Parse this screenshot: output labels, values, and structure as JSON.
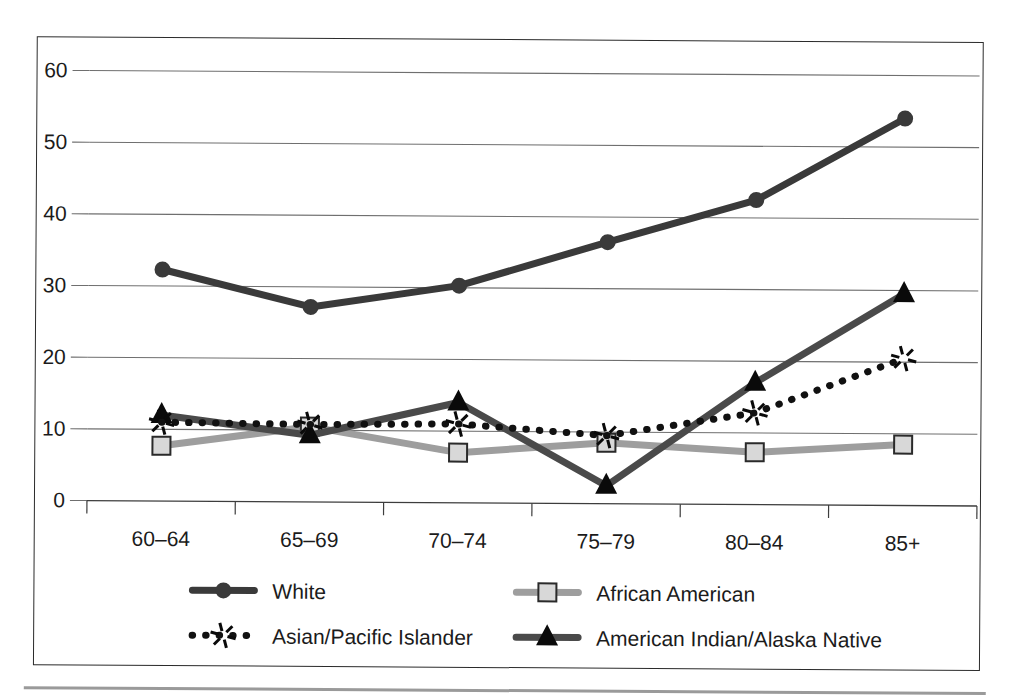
{
  "chart_data": {
    "type": "line",
    "title": "",
    "subtitle": "",
    "xlabel": "",
    "ylabel": "",
    "categories": [
      "60–64",
      "65–69",
      "70–74",
      "75–79",
      "80–84",
      "85+"
    ],
    "ylim": [
      0,
      60
    ],
    "yticks": [
      0,
      10,
      20,
      30,
      40,
      50,
      60
    ],
    "ytick_labels": [
      "0",
      "10",
      "20",
      "30",
      "40",
      "50",
      "60"
    ],
    "grid": true,
    "grid_axis": "y",
    "legend_position": "bottom",
    "series": [
      {
        "name": "White",
        "marker": "circle",
        "color": "#3a3a3a",
        "linestyle": "solid",
        "values": [
          32.3,
          27.2,
          30.3,
          36.5,
          42.5,
          54.0
        ]
      },
      {
        "name": "African American",
        "marker": "square",
        "color": "#9e9e9e",
        "linestyle": "solid",
        "values": [
          7.7,
          10.5,
          7.0,
          8.5,
          7.3,
          8.5
        ]
      },
      {
        "name": "Asian/Pacific Islander",
        "marker": "asterisk",
        "color": "#111111",
        "linestyle": "dotted",
        "values": [
          11.0,
          10.8,
          11.0,
          9.5,
          12.8,
          20.5
        ]
      },
      {
        "name": "American Indian/Alaska Native",
        "marker": "triangle",
        "color": "#4a4a4a",
        "linestyle": "solid",
        "values": [
          12.0,
          9.3,
          14.0,
          2.5,
          17.0,
          29.5
        ]
      }
    ]
  },
  "legend": {
    "entries": [
      {
        "label": "White",
        "marker": "circle"
      },
      {
        "label": "African American",
        "marker": "square"
      },
      {
        "label": "Asian/Pacific Islander",
        "marker": "asterisk"
      },
      {
        "label": "American Indian/Alaska Native",
        "marker": "triangle"
      }
    ]
  },
  "colors": {
    "white_series": "#3a3a3a",
    "african_american_series": "#9e9e9e",
    "asian_pacific_series": "#111111",
    "american_indian_series": "#4a4a4a",
    "gridline": "#6f6f6f",
    "axis": "#3d3d3d",
    "frame": "#2b2b2b",
    "text": "#1b1b1b"
  }
}
